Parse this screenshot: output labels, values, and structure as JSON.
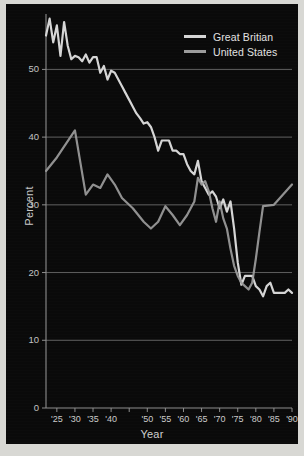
{
  "figure": {
    "background_color": "#0a0a0a",
    "page_background_color": "#d8d8d4",
    "axis_color": "#8e8e8e",
    "grid_color": "#6a6a6a",
    "text_color": "#cfcfcf"
  },
  "axes": {
    "ylabel": "Percent",
    "xlabel": "Year",
    "y_ticks": [
      "0",
      "10",
      "20",
      "30",
      "40",
      "50"
    ],
    "x_ticks": [
      "'25",
      "'30",
      "'35",
      "'40",
      "'50",
      "'55",
      "'60",
      "'65",
      "'70",
      "'75",
      "'80",
      "'85",
      "'90"
    ]
  },
  "legend": {
    "position": "top-right",
    "entries": [
      {
        "label": "Great Britian",
        "color": "#d5d5d5"
      },
      {
        "label": "United States",
        "color": "#9c9c9c"
      }
    ]
  },
  "chart_data": {
    "type": "line",
    "title": "",
    "subtitle": "",
    "xlabel": "Year",
    "ylabel": "Percent",
    "xlim": [
      1922,
      1990
    ],
    "ylim": [
      0,
      57
    ],
    "grid": true,
    "grid_axis": "y",
    "legend_position": "top-right",
    "annotations": [],
    "x_tick_labels": [
      "'25",
      "'30",
      "'35",
      "'40",
      "'50",
      "'55",
      "'60",
      "'65",
      "'70",
      "'75",
      "'80",
      "'85",
      "'90"
    ],
    "x_tick_values": [
      1925,
      1930,
      1935,
      1940,
      1950,
      1955,
      1960,
      1965,
      1970,
      1975,
      1980,
      1985,
      1990
    ],
    "y_tick_values": [
      0,
      10,
      20,
      30,
      40,
      50
    ],
    "series": [
      {
        "name": "Great Britian",
        "color": "#d5d5d5",
        "x": [
          1922,
          1923,
          1924,
          1925,
          1926,
          1927,
          1928,
          1929,
          1930,
          1931,
          1932,
          1933,
          1934,
          1935,
          1936,
          1937,
          1938,
          1939,
          1940,
          1941,
          1942,
          1943,
          1944,
          1945,
          1946,
          1947,
          1948,
          1949,
          1950,
          1951,
          1952,
          1953,
          1954,
          1955,
          1956,
          1957,
          1958,
          1959,
          1960,
          1961,
          1962,
          1963,
          1964,
          1965,
          1966,
          1967,
          1968,
          1969,
          1970,
          1971,
          1972,
          1973,
          1974,
          1975,
          1976,
          1977,
          1978,
          1979,
          1980,
          1981,
          1982,
          1983,
          1984,
          1985,
          1986,
          1987,
          1988,
          1989,
          1990
        ],
        "values": [
          55.0,
          57.5,
          54.0,
          56.5,
          52.0,
          57.0,
          53.5,
          51.5,
          52.0,
          51.8,
          51.2,
          52.2,
          51.0,
          51.8,
          51.8,
          49.5,
          50.5,
          48.5,
          49.8,
          49.5,
          48.5,
          47.5,
          46.5,
          45.5,
          44.5,
          43.5,
          42.8,
          42.0,
          42.2,
          41.5,
          40.0,
          38.0,
          39.5,
          39.5,
          39.5,
          38.0,
          38.0,
          37.5,
          37.5,
          36.0,
          35.0,
          34.5,
          36.5,
          33.5,
          32.5,
          31.5,
          32.0,
          31.2,
          29.5,
          30.8,
          29.0,
          30.5,
          26.5,
          21.5,
          18.2,
          19.5,
          19.5,
          19.5,
          18.0,
          17.5,
          16.5,
          18.0,
          18.5,
          17.0,
          17.0,
          17.0,
          17.0,
          17.5,
          17.0
        ]
      },
      {
        "name": "United States",
        "color": "#9c9c9c",
        "x": [
          1922,
          1925,
          1930,
          1933,
          1935,
          1937,
          1939,
          1941,
          1943,
          1946,
          1949,
          1951,
          1953,
          1955,
          1957,
          1959,
          1961,
          1963,
          1964,
          1965,
          1966,
          1967,
          1968,
          1969,
          1970,
          1971,
          1972,
          1973,
          1974,
          1975,
          1976,
          1977,
          1978,
          1979,
          1980,
          1981,
          1982,
          1985,
          1990
        ],
        "values": [
          35.0,
          37.0,
          41.0,
          31.5,
          33.0,
          32.5,
          34.5,
          33.0,
          31.0,
          29.5,
          27.5,
          26.5,
          27.5,
          29.8,
          28.5,
          27.0,
          28.5,
          30.5,
          34.0,
          33.0,
          33.5,
          32.0,
          29.5,
          27.5,
          30.5,
          28.0,
          26.5,
          23.5,
          21.0,
          19.5,
          18.5,
          18.0,
          17.5,
          18.5,
          22.0,
          26.0,
          29.8,
          30.0,
          33.0
        ]
      }
    ]
  }
}
